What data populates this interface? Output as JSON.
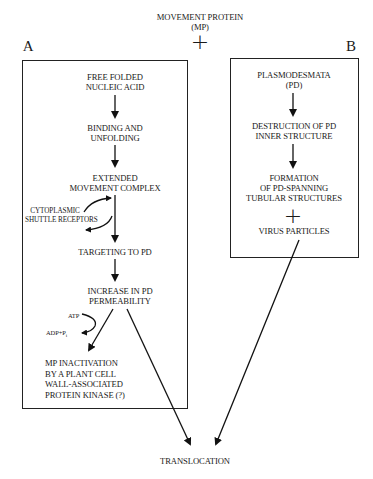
{
  "header": {
    "title_line1": "MOVEMENT PROTEIN",
    "title_line2": "(MP)",
    "plus": "+"
  },
  "panel_a": {
    "label": "A",
    "steps": [
      "FREE FOLDED\nNUCLEIC ACID",
      "BINDING AND\nUNFOLDING",
      "EXTENDED\nMOVEMENT COMPLEX",
      "TARGETING TO PD",
      "INCREASE IN PD\nPERMEABILITY",
      "MP INACTIVATION\nBY A PLANT CELL\nWALL-ASSOCIATED\nPROTEIN KINASE (?)"
    ],
    "side_label": "CYTOPLASMIC\nSHUTTLE RECEPTORS",
    "atp": "ATP",
    "adp": "ADP+P",
    "adp_sub": "i"
  },
  "panel_b": {
    "label": "B",
    "steps": [
      "PLASMODESMATA\n(PD)",
      "DESTRUCTION OF PD\nINNER STRUCTURE",
      "FORMATION\nOF PD-SPANNING\nTUBULAR STRUCTURES"
    ],
    "plus": "+",
    "virus": "VIRUS PARTICLES"
  },
  "footer": {
    "result": "TRANSLOCATION"
  }
}
